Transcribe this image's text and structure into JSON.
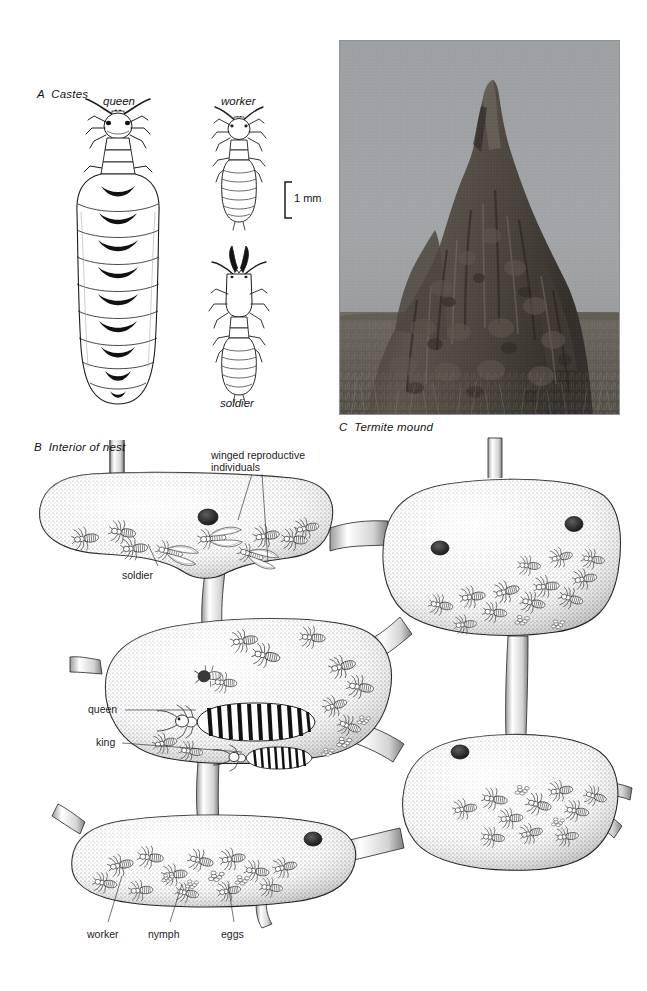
{
  "figure": {
    "type": "scientific-plate",
    "background_color": "#ffffff",
    "ink_color": "#131313"
  },
  "panels": [
    {
      "id": "A",
      "letter": "A",
      "title": "Castes",
      "label": "A  Castes",
      "position": {
        "x": 37,
        "y": 88
      }
    },
    {
      "id": "B",
      "letter": "B",
      "title": "Interior of nest",
      "label": "B  Interior of nest",
      "position": {
        "x": 34,
        "y": 441
      }
    },
    {
      "id": "C",
      "letter": "C",
      "title": "Termite mound",
      "label": "C  Termite mound",
      "position": {
        "x": 339,
        "y": 421
      }
    }
  ],
  "panel_a": {
    "castes": [
      {
        "name": "queen",
        "label_x": 103,
        "label_y": 95,
        "note": "physogastric, greatly enlarged banded abdomen"
      },
      {
        "name": "worker",
        "label_x": 221,
        "label_y": 95,
        "note": "pale, rounded head, small"
      },
      {
        "name": "soldier",
        "label_x": 220,
        "label_y": 397,
        "note": "dark curved mandibles, elongate head"
      }
    ],
    "scale_bar": {
      "label": "1 mm",
      "x": 288,
      "y": 181,
      "height_px": 36,
      "units": "mm",
      "value": 1
    }
  },
  "panel_b": {
    "callouts": [
      {
        "text": "winged reproductive\nindividuals",
        "x": 211,
        "y": 450,
        "align": "left"
      },
      {
        "text": "soldier",
        "x": 122,
        "y": 570,
        "align": "left"
      },
      {
        "text": "queen",
        "x": 88,
        "y": 712,
        "align": "left"
      },
      {
        "text": "king",
        "x": 96,
        "y": 745,
        "align": "left"
      },
      {
        "text": "worker",
        "x": 87,
        "y": 929,
        "align": "left"
      },
      {
        "text": "nymph",
        "x": 148,
        "y": 929,
        "align": "left"
      },
      {
        "text": "eggs",
        "x": 221,
        "y": 929,
        "align": "left"
      }
    ],
    "chambers": [
      {
        "id": "chamber-upper-left",
        "contents": [
          "soldier",
          "workers",
          "winged reproductive individuals"
        ]
      },
      {
        "id": "chamber-upper-right",
        "contents": [
          "workers",
          "nymphs"
        ]
      },
      {
        "id": "chamber-royal",
        "contents": [
          "queen",
          "king",
          "workers",
          "eggs"
        ]
      },
      {
        "id": "chamber-lower-right",
        "contents": [
          "workers",
          "nymphs"
        ]
      },
      {
        "id": "chamber-lower-left",
        "contents": [
          "workers",
          "nymphs",
          "eggs"
        ]
      }
    ],
    "connections": 6
  },
  "panel_c": {
    "photograph": {
      "caption": "Termite mound",
      "scene": "tall eroded termite mound on open grassland under pale sky",
      "frame": {
        "x": 339,
        "y": 40,
        "width": 281,
        "height": 375
      },
      "sky_color": "#9a9da0",
      "mound_color": "#4b4540",
      "grass_color": "#6e6a60"
    }
  }
}
